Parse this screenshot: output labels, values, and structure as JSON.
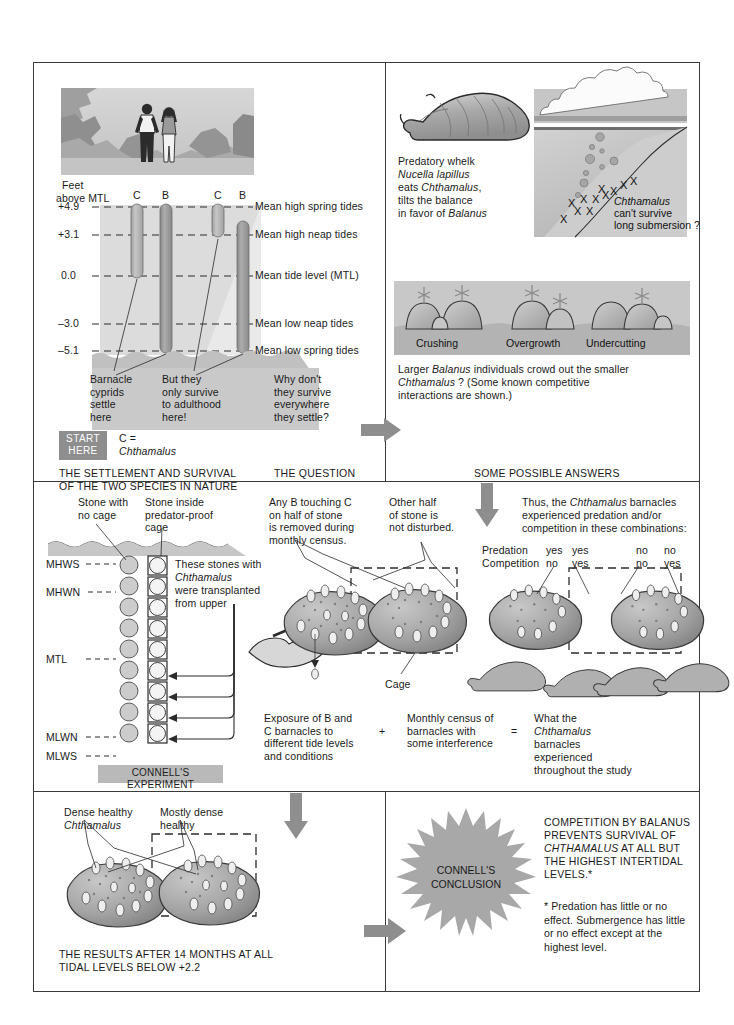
{
  "panel1": {
    "axis_title_line1": "Feet",
    "axis_title_line2": "above MTL",
    "tick_values": [
      "+4.9",
      "+3.1",
      "0.0",
      "–3.0",
      "–5.1"
    ],
    "tide_lines": [
      "Mean high spring tides",
      "Mean high neap tides",
      "Mean tide level (MTL)",
      "Mean low neap tides",
      "Mean low spring tides"
    ],
    "bar_labels": [
      "C",
      "B",
      "C",
      "B"
    ],
    "note1": "Barnacle\ncyprids\nsettle\nhere",
    "note2": "But they\nonly survive\nto adulthood\nhere!",
    "note3": "Why don't\nthey survive\neverywhere\nthey settle?",
    "start_here": "START\nHERE",
    "legend_line1": "C =",
    "legend_line2": "Chthamalus",
    "caption": "THE SETTLEMENT AND SURVIVAL\nOF THE TWO SPECIES IN NATURE",
    "question_caption": "THE QUESTION"
  },
  "panel2": {
    "whelk_text_lines": [
      {
        "plain": "Predatory whelk"
      },
      {
        "italic": "Nucella lapillus"
      },
      {
        "pre": "eats ",
        "italic": "Chthamalus",
        "post": ","
      },
      {
        "plain": "tilts the balance"
      },
      {
        "pre": "in favor of ",
        "italic": "Balanus"
      }
    ],
    "submersion_line1": "Chthamalus",
    "submersion_line2": "can't survive",
    "submersion_line3": "long submersion ?",
    "interaction_labels": [
      "Crushing",
      "Overgrowth",
      "Undercutting"
    ],
    "crowd_text_line1_pre": "Larger ",
    "crowd_text_line1_italic": "Balanus",
    "crowd_text_line1_post": " individuals crowd out the smaller",
    "crowd_text_line2_italic": "Chthamalus",
    "crowd_text_line2_post": " ? (Some known competitive",
    "crowd_text_line3": "interactions are shown.)",
    "caption": "SOME POSSIBLE ANSWERS"
  },
  "panel3": {
    "label_no_cage": "Stone with\nno cage",
    "label_cage": "Stone inside\npredator-proof\ncage",
    "transplant_line1": "These stones with",
    "transplant_line2_italic": "Chthamalus",
    "transplant_line3": "were transplanted",
    "transplant_line4": "from upper",
    "tide_marks": [
      "MHWS",
      "MHWN",
      "MTL",
      "MLWN",
      "MLWS"
    ],
    "experiment_box": "CONNELL'S EXPERIMENT",
    "removed_note": "Any B touching C\non half of stone\nis removed during\nmonthly census.",
    "undisturbed_note": "Other half\nof stone is\nnot disturbed.",
    "cage_label": "Cage",
    "thus_note": "Thus, the Chthamalus barnacles\nexperienced predation and/or\ncompetition in these combinations:",
    "thus_note_line1_pre": "Thus, the ",
    "thus_note_line1_italic": "Chthamalus",
    "thus_note_line1_post": " barnacles",
    "thus_note_line2": "experienced predation and/or",
    "thus_note_line3": "competition in these combinations:",
    "matrix_row_labels": [
      "Predation",
      "Competition"
    ],
    "matrix_values": [
      [
        "yes",
        "yes",
        "no",
        "no"
      ],
      [
        "no",
        "yes",
        "no",
        "yes"
      ]
    ],
    "equation": {
      "term1": "Exposure of B and\nC barnacles to\ndifferent tide levels\nand conditions",
      "plus": "+",
      "term2": "Monthly census of\nbarnacles with\nsome interference",
      "equals": "=",
      "term3_line1": "What the",
      "term3_line2_italic": "Chthamalus",
      "term3_line3": "barnacles",
      "term3_line4": "experienced",
      "term3_line5": "throughout the study"
    }
  },
  "panel4": {
    "label_dense_line1": "Dense healthy",
    "label_dense_line2_italic": "Chthamalus",
    "label_mostly": "Mostly dense\nhealthy",
    "caption": "THE RESULTS AFTER 14 MONTHS AT ALL\nTIDAL LEVELS BELOW +2.2"
  },
  "panel5": {
    "burst_line1": "CONNELL'S",
    "burst_line2": "CONCLUSION",
    "conclusion_line1": "COMPETITION BY BALANUS",
    "conclusion_line2": "PREVENTS SURVIVAL OF",
    "conclusion_line3_italic": "CHTHAMALUS",
    "conclusion_line3_post": " AT ALL BUT",
    "conclusion_line4": "THE HIGHEST INTERTIDAL",
    "conclusion_line5": "LEVELS.*",
    "footnote": "* Predation has little or no\neffect. Submergence has little\nor no effect except at the\nhighest level."
  },
  "colors": {
    "ink": "#1a1a1a",
    "frame": "#3a3a3a",
    "arrow_gray": "#8e8e8e",
    "bar_c": "#b6b6b6",
    "bar_b": "#9a9a9a",
    "water": "#d9d9d9",
    "rock": "#bdbdbd",
    "start_box": "#8e8e8e",
    "exp_box": "#b9b9b9",
    "burst": "#a8a8a8"
  }
}
